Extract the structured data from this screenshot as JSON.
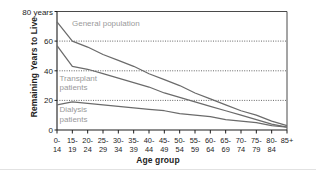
{
  "figure": {
    "ylabel": "Remaining Years to Live",
    "xlabel": "Age group",
    "top_axis_note": "80 years"
  },
  "axis": {
    "y_ticks": [
      "80 years",
      "60",
      "40",
      "20",
      "0"
    ],
    "y_tick_values": [
      80,
      60,
      40,
      20,
      0
    ],
    "x_tick_top": [
      "0-",
      "15-",
      "20-",
      "25-",
      "30-",
      "35-",
      "40-",
      "45-",
      "50-",
      "55-",
      "60-",
      "65-",
      "70-",
      "75-",
      "80-",
      "85+"
    ],
    "x_tick_bottom": [
      "14",
      "19",
      "24",
      "29",
      "34",
      "39",
      "44",
      "49",
      "54",
      "59",
      "64",
      "69",
      "74",
      "79",
      "84",
      ""
    ]
  },
  "annotations": {
    "general_population": "General population",
    "transplant_line1": "Transplant",
    "transplant_line2": "patients",
    "dialysis_line1": "Dialysis",
    "dialysis_line2": "patients"
  },
  "colors": {
    "axis": "#1d1d1d",
    "curve": "#6b6b6b",
    "grid": "#555555",
    "label_gray": "#9a9a9a",
    "frame": "#4a4a4a"
  },
  "chart_data": {
    "type": "line",
    "title": "",
    "xlabel": "Age group",
    "ylabel": "Remaining Years to Live",
    "ylim": [
      0,
      80
    ],
    "grid": "horizontal dotted at 20, 40, 60",
    "legend": "inline labels on plot",
    "categories": [
      "0-14",
      "15-19",
      "20-24",
      "25-29",
      "30-34",
      "35-39",
      "40-44",
      "45-49",
      "50-54",
      "55-59",
      "60-64",
      "65-69",
      "70-74",
      "75-79",
      "80-84",
      "85+"
    ],
    "series": [
      {
        "name": "General population",
        "values": [
          73,
          60,
          56,
          51,
          47,
          43,
          38,
          34,
          30,
          25,
          21,
          17,
          13,
          10,
          6,
          3
        ]
      },
      {
        "name": "Transplant patients",
        "values": [
          57,
          43,
          41,
          38,
          35,
          32,
          29,
          25,
          22,
          19,
          16,
          13,
          10,
          7,
          4,
          2
        ]
      },
      {
        "name": "Dialysis patients",
        "values": [
          17,
          19,
          18,
          17,
          16,
          15,
          14,
          13,
          11,
          10,
          9,
          7,
          6,
          5,
          3,
          2
        ]
      }
    ]
  }
}
